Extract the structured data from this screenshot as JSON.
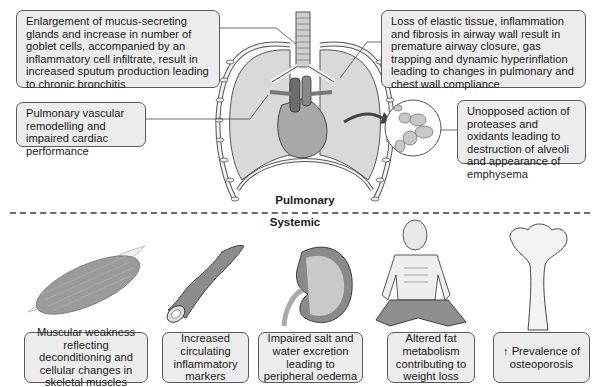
{
  "pulmonary": {
    "section_label": "Pulmonary",
    "callouts": [
      {
        "id": "mucus",
        "text": "Enlargement of mucus-secreting glands and increase in number of goblet cells, accompanied by an inflammatory cell infiltrate, result in increased sputum production leading to chronic bronchitis"
      },
      {
        "id": "vascular",
        "text": "Pulmonary vascular remodelling and impaired cardiac performance"
      },
      {
        "id": "elastic",
        "text": "Loss of elastic tissue, inflammation and fibrosis in airway wall result in premature airway closure, gas trapping and dynamic hyperinflation leading to changes in pulmonary and chest wall compliance"
      },
      {
        "id": "emphysema",
        "text": "Unopposed action of proteases and oxidants leading to destruction of alveoli and appearance of emphysema"
      }
    ],
    "illustrations": [
      "lungs-and-heart",
      "alveoli-magnified"
    ]
  },
  "systemic": {
    "section_label": "Systemic",
    "items": [
      {
        "id": "muscle",
        "illustration": "skeletal-muscle",
        "text": "Muscular weakness reflecting deconditioning and cellular changes in skeletal muscles"
      },
      {
        "id": "vessel",
        "illustration": "blood-vessel",
        "text": "Increased circulating inflammatory markers"
      },
      {
        "id": "kidney",
        "illustration": "kidney",
        "text": "Impaired salt and water excretion leading to peripheral oedema"
      },
      {
        "id": "weight",
        "illustration": "emaciated-man",
        "text": "Altered fat metabolism contributing to weight loss"
      },
      {
        "id": "bone",
        "illustration": "femur-bone",
        "text": "↑ Prevalence of osteoporosis"
      }
    ]
  },
  "colors": {
    "box_fill": "#ececec",
    "box_border": "#5a5a5a",
    "lung_fill": "#d9d9d9",
    "organ_fill": "#9a9a9a",
    "divider": "#6a6a6a"
  }
}
